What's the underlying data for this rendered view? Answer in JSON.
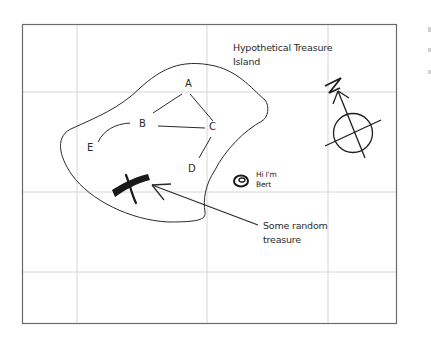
{
  "title_line1": "Hypothetical Treasure",
  "title_line2": "Island",
  "nodes": {
    "A": "A",
    "B": "B",
    "C": "C",
    "D": "D",
    "E": "E"
  },
  "bert_line1": "Hi I'm",
  "bert_line2": "Bert",
  "treasure_line1": "Some random",
  "treasure_line2": "treasure",
  "compass_label": "N",
  "colors": {
    "frame": "#6b6b6b",
    "grid": "#d4d4d4",
    "ink": "#1e1e1e"
  }
}
